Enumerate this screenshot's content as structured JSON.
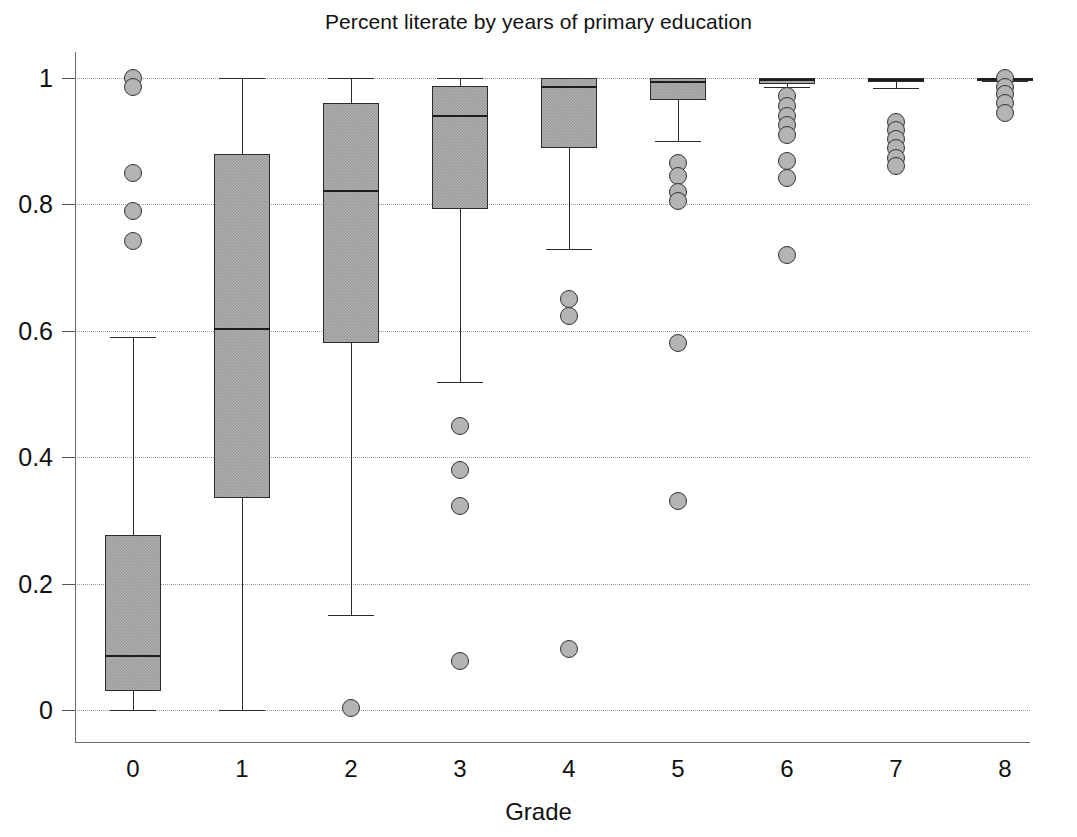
{
  "chart_data": {
    "type": "box",
    "title": "Percent literate by years of primary education",
    "xlabel": "Grade",
    "ylabel": "",
    "categories": [
      "0",
      "1",
      "2",
      "3",
      "4",
      "5",
      "6",
      "7",
      "8"
    ],
    "xtick_labels": [
      "0",
      "1",
      "2",
      "3",
      "4",
      "5",
      "6",
      "7",
      "8"
    ],
    "ytick_labels": [
      "0",
      "0.2",
      "0.4",
      "0.6",
      "0.8",
      "1"
    ],
    "ytick_values": [
      0,
      0.2,
      0.4,
      0.6,
      0.8,
      1
    ],
    "ylim": [
      0,
      1
    ],
    "grid": "horizontal-dotted",
    "legend": "none",
    "box_fill": "#9c9c9c",
    "box_stroke": "#2b2b2b",
    "outlier_fill": "#b4b4b4",
    "outlier_stroke": "#333333",
    "grid_color": "#9a9a9a",
    "axis_color": "#6b6b6b",
    "boxes": [
      {
        "category": "0",
        "whisker_low": 0.0,
        "q1": 0.03,
        "median": 0.087,
        "q3": 0.277,
        "whisker_high": 0.59,
        "outliers": [
          1.0,
          0.985,
          0.85,
          0.79,
          0.742
        ]
      },
      {
        "category": "1",
        "whisker_low": 0.0,
        "q1": 0.335,
        "median": 0.605,
        "q3": 0.88,
        "whisker_high": 1.0,
        "outliers": []
      },
      {
        "category": "2",
        "whisker_low": 0.15,
        "q1": 0.58,
        "median": 0.823,
        "q3": 0.96,
        "whisker_high": 1.0,
        "outliers": [
          0.003
        ]
      },
      {
        "category": "3",
        "whisker_low": 0.519,
        "q1": 0.793,
        "median": 0.941,
        "q3": 0.988,
        "whisker_high": 1.0,
        "outliers": [
          0.45,
          0.38,
          0.322,
          0.078
        ]
      },
      {
        "category": "4",
        "whisker_low": 0.73,
        "q1": 0.89,
        "median": 0.988,
        "q3": 1.0,
        "whisker_high": 1.0,
        "outliers": [
          0.65,
          0.623,
          0.097
        ]
      },
      {
        "category": "5",
        "whisker_low": 0.9,
        "q1": 0.965,
        "median": 0.996,
        "q3": 1.0,
        "whisker_high": 1.0,
        "outliers": [
          0.866,
          0.845,
          0.82,
          0.806,
          0.58,
          0.331
        ]
      },
      {
        "category": "6",
        "whisker_low": 0.985,
        "q1": 0.991,
        "median": 0.998,
        "q3": 1.0,
        "whisker_high": 1.0,
        "outliers": [
          0.972,
          0.956,
          0.94,
          0.926,
          0.91,
          0.868,
          0.842,
          0.72
        ]
      },
      {
        "category": "7",
        "whisker_low": 0.984,
        "q1": 0.993,
        "median": 0.998,
        "q3": 1.0,
        "whisker_high": 1.0,
        "outliers": [
          0.931,
          0.918,
          0.903,
          0.889,
          0.874,
          0.861
        ]
      },
      {
        "category": "8",
        "whisker_low": 0.996,
        "q1": 0.998,
        "median": 1.0,
        "q3": 1.0,
        "whisker_high": 1.0,
        "outliers": [
          1.0,
          0.986,
          0.974,
          0.96,
          0.945
        ]
      }
    ]
  }
}
